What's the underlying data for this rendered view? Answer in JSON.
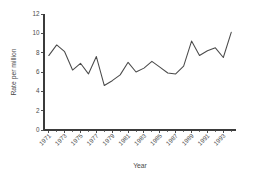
{
  "chart_data": {
    "type": "line",
    "title": "",
    "xlabel": "Year",
    "ylabel": "Rate per million",
    "xlim": [
      1970.4,
      1994.6
    ],
    "ylim": [
      0,
      12
    ],
    "grid": false,
    "legend": false,
    "legend_position": "none",
    "line_color": "#4a4a4a",
    "axis_color": "#3b3b3b",
    "x": [
      1971,
      1972,
      1973,
      1974,
      1975,
      1976,
      1977,
      1978,
      1979,
      1980,
      1981,
      1982,
      1983,
      1984,
      1985,
      1986,
      1987,
      1988,
      1989,
      1990,
      1991,
      1992,
      1993,
      1994
    ],
    "values": [
      7.7,
      8.8,
      8.1,
      6.2,
      6.9,
      5.8,
      7.6,
      4.6,
      5.1,
      5.7,
      7.0,
      6.0,
      6.4,
      7.1,
      6.5,
      5.9,
      5.8,
      6.6,
      9.2,
      7.7,
      8.2,
      8.5,
      7.5,
      10.1
    ],
    "ytick_values": [
      0,
      2,
      4,
      6,
      8,
      10,
      12
    ],
    "ytick_labels": [
      "0",
      "2",
      "4",
      "6",
      "8",
      "10",
      "12"
    ],
    "xtick_values": [
      1971,
      1973,
      1975,
      1977,
      1979,
      1981,
      1983,
      1985,
      1987,
      1989,
      1991,
      1993
    ],
    "xtick_labels": [
      "1971",
      "1973",
      "1975",
      "1977",
      "1979",
      "1981",
      "1983",
      "1985",
      "1987",
      "1989",
      "1991",
      "1993"
    ],
    "xtick_minor_values": [
      1972,
      1974,
      1976,
      1978,
      1980,
      1982,
      1984,
      1986,
      1988,
      1990,
      1992,
      1994
    ]
  }
}
